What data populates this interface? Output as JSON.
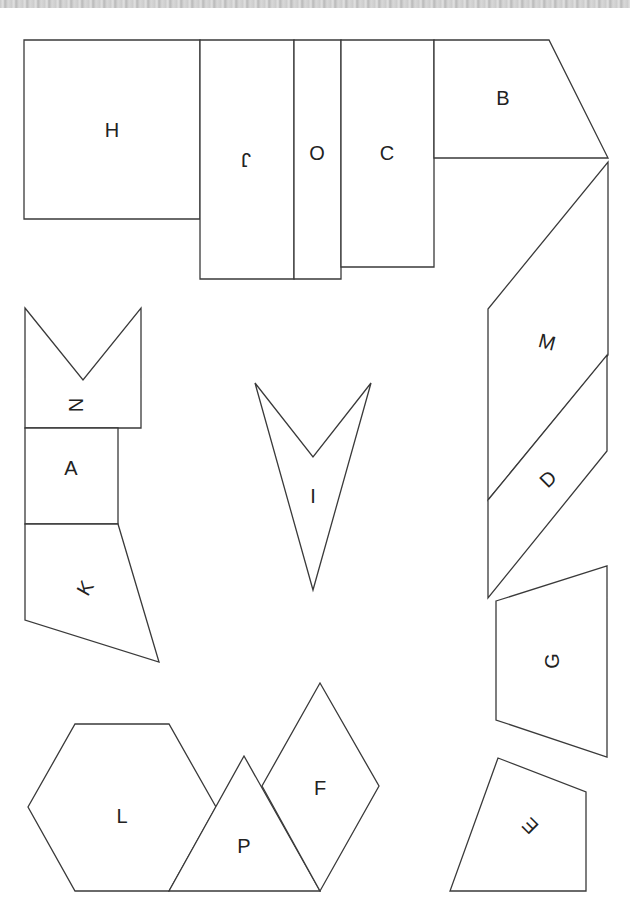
{
  "sheet": {
    "background": "#ffffff",
    "stroke_color": "#3a3a3a",
    "label_color": "#222222"
  },
  "pieces": [
    {
      "id": "H",
      "label": "H",
      "points": "24,40 200,40 200,219 24,219",
      "label_x": 112,
      "label_y": 130,
      "rotate": 0
    },
    {
      "id": "J",
      "label": "J",
      "points": "200,40 294,40 294,279 200,279",
      "label_x": 246,
      "label_y": 160,
      "rotate": 180
    },
    {
      "id": "O",
      "label": "O",
      "points": "294,40 341,40 341,279 294,279",
      "label_x": 317,
      "label_y": 153,
      "rotate": 0
    },
    {
      "id": "C",
      "label": "C",
      "points": "341,40 434,40 434,267 341,267",
      "label_x": 387,
      "label_y": 153,
      "rotate": 0
    },
    {
      "id": "B",
      "label": "B",
      "points": "434,40 549,40 608,158 434,158",
      "label_x": 503,
      "label_y": 98,
      "rotate": 0
    },
    {
      "id": "M",
      "label": "M",
      "points": "608,162 608,355 488,500 488,309",
      "label_x": 547,
      "label_y": 342,
      "rotate": 15
    },
    {
      "id": "D",
      "label": "D",
      "points": "607,355 607,451 488,598 488,500",
      "label_x": 548,
      "label_y": 479,
      "rotate": -45
    },
    {
      "id": "N",
      "label": "N",
      "points": "25,308 83,380 141,308 141,428 25,428",
      "label_x": 76,
      "label_y": 405,
      "rotate": 90
    },
    {
      "id": "A",
      "label": "A",
      "points": "25,428 118,428 118,524 25,524",
      "label_x": 71,
      "label_y": 468,
      "rotate": 0
    },
    {
      "id": "K",
      "label": "K",
      "points": "25,524 118,524 159,662 25,620",
      "label_x": 85,
      "label_y": 588,
      "rotate": -60
    },
    {
      "id": "I",
      "label": "I",
      "points": "255,383 313,457 371,383 313,590",
      "label_x": 313,
      "label_y": 496,
      "rotate": 0
    },
    {
      "id": "G",
      "label": "G",
      "points": "496,601 607,566 607,757 496,720",
      "label_x": 552,
      "label_y": 661,
      "rotate": -90
    },
    {
      "id": "E",
      "label": "E",
      "points": "498,758 586,792 586,891 450,891",
      "label_x": 530,
      "label_y": 826,
      "rotate": -135
    },
    {
      "id": "L",
      "label": "L",
      "points": "75,724 169,724 216,807 169,891 75,891 28,807",
      "label_x": 122,
      "label_y": 816,
      "rotate": 0
    },
    {
      "id": "P",
      "label": "P",
      "points": "169,891 244,756 320,891",
      "label_x": 244,
      "label_y": 846,
      "rotate": 0
    },
    {
      "id": "F",
      "label": "F",
      "points": "320,683 379,786 320,891 262,786",
      "label_x": 320,
      "label_y": 788,
      "rotate": 0
    }
  ]
}
